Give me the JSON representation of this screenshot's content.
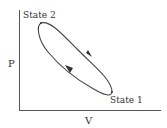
{
  "diagram": {
    "title": "",
    "axes": {
      "x_label": "V",
      "y_label": "P"
    },
    "states": [
      {
        "label": "State 2",
        "position": "upper-left"
      },
      {
        "label": "State 1",
        "position": "lower-right"
      }
    ],
    "cycle": {
      "shape": "closed loop",
      "direction": "clockwise",
      "arrows": [
        {
          "segment": "upper path",
          "direction": "State 2 to State 1"
        },
        {
          "segment": "lower path",
          "direction": "State 1 to State 2"
        }
      ]
    },
    "colors": {
      "line": "#444444",
      "text": "#333333",
      "background": "#ffffff"
    }
  }
}
